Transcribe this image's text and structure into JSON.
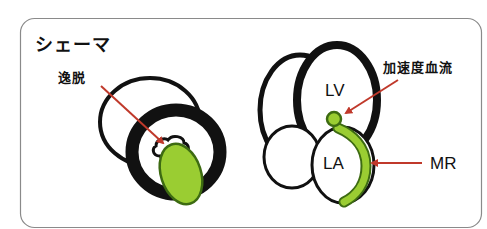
{
  "title": "シェーマ",
  "colors": {
    "outline": "#111111",
    "frame": "#8a8a8a",
    "arrow": "#c0392b",
    "green_fill": "#9acd32",
    "green_stroke": "#3d6b12"
  },
  "left_diagram": {
    "label": "逸脱",
    "description": "short-axis view with prolapsing leaflet (green)"
  },
  "right_diagram": {
    "chambers": {
      "lv": "LV",
      "la": "LA"
    },
    "labels": {
      "accelerated_flow": "加速度血流",
      "regurgitation": "MR"
    }
  }
}
